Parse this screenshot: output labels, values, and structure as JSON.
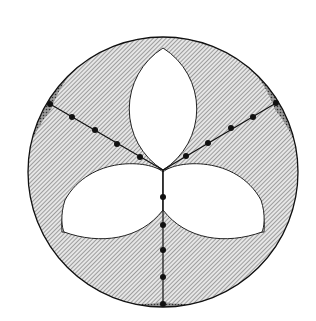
{
  "diagram": {
    "outer_circle": {
      "cx": 163,
      "cy": 172,
      "r": 135
    },
    "center_point": {
      "x": 163,
      "y": 170
    },
    "colors": {
      "hatch": "#555555",
      "fill_light": "#d8d8d8",
      "fill_dark": "#7a7a7a",
      "stroke": "#111111",
      "background": "#ffffff"
    },
    "arms": [
      {
        "name": "upper-left",
        "dots": [
          [
            50,
            104
          ],
          [
            72,
            117
          ],
          [
            95,
            130
          ],
          [
            117,
            144
          ],
          [
            140,
            157
          ]
        ]
      },
      {
        "name": "upper-right",
        "dots": [
          [
            276,
            103
          ],
          [
            253,
            117
          ],
          [
            231,
            128
          ],
          [
            208,
            143
          ],
          [
            186,
            156
          ]
        ]
      },
      {
        "name": "bottom",
        "dots": [
          [
            163,
            197
          ],
          [
            163,
            225
          ],
          [
            163,
            250
          ],
          [
            163,
            277
          ],
          [
            163,
            304
          ]
        ]
      }
    ]
  }
}
